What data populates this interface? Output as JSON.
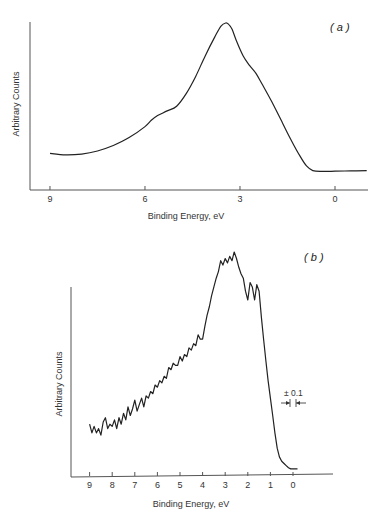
{
  "chart_data": [
    {
      "type": "line",
      "panel_label": "( a )",
      "title": "",
      "xlabel": "Binding Energy, eV",
      "ylabel": "Arbitrary Counts",
      "x_ticks": [
        9,
        6,
        3,
        0
      ],
      "x_tick_labels": [
        "9",
        "6",
        "3",
        "0"
      ],
      "xlim": [
        9.3,
        -1.0
      ],
      "ylim": [
        0,
        100
      ],
      "x_reversed": true,
      "grid": false,
      "legend": null,
      "series": [
        {
          "name": "Spectrum (a)",
          "x": [
            9.0,
            8.5,
            8.0,
            7.5,
            7.0,
            6.5,
            6.0,
            5.8,
            5.6,
            5.3,
            5.0,
            4.7,
            4.4,
            4.1,
            3.8,
            3.6,
            3.45,
            3.35,
            3.25,
            3.1,
            2.9,
            2.7,
            2.5,
            2.3,
            2.0,
            1.7,
            1.4,
            1.1,
            0.9,
            0.7,
            0.4,
            0.0,
            -0.5,
            -1.0
          ],
          "y": [
            17,
            16,
            16.5,
            18.5,
            22,
            27,
            34,
            38,
            41,
            44,
            47,
            55,
            66,
            79,
            91,
            98,
            100,
            99,
            96,
            88,
            79,
            73,
            68,
            61,
            50,
            38,
            26,
            15,
            9,
            6,
            5.5,
            5.6,
            5.8,
            6
          ]
        }
      ]
    },
    {
      "type": "line",
      "panel_label": "( b )",
      "title": "",
      "xlabel": "Binding Energy, eV",
      "ylabel": "Arbitrary Counts",
      "x_ticks": [
        9,
        8,
        7,
        6,
        5,
        4,
        3,
        2,
        1,
        0
      ],
      "x_tick_labels": [
        "9",
        "8",
        "7",
        "6",
        "5",
        "4",
        "3",
        "2",
        "1",
        "0"
      ],
      "xlim": [
        9.8,
        -1.8
      ],
      "ylim": [
        0,
        100
      ],
      "x_reversed": true,
      "grid": false,
      "legend": null,
      "annotations": [
        {
          "text": "± 0.1",
          "x": 0.5,
          "y": 36,
          "note": "energy resolution bar with inward arrows"
        }
      ],
      "series": [
        {
          "name": "Spectrum (b)",
          "x": [
            9.0,
            8.9,
            8.8,
            8.7,
            8.6,
            8.5,
            8.4,
            8.3,
            8.2,
            8.1,
            8.0,
            7.9,
            7.8,
            7.7,
            7.6,
            7.5,
            7.4,
            7.3,
            7.2,
            7.1,
            7.0,
            6.9,
            6.8,
            6.7,
            6.6,
            6.5,
            6.4,
            6.3,
            6.2,
            6.1,
            6.0,
            5.9,
            5.8,
            5.7,
            5.6,
            5.5,
            5.4,
            5.3,
            5.2,
            5.1,
            5.0,
            4.9,
            4.8,
            4.7,
            4.6,
            4.5,
            4.4,
            4.3,
            4.2,
            4.1,
            4.0,
            3.9,
            3.8,
            3.7,
            3.6,
            3.5,
            3.4,
            3.3,
            3.2,
            3.1,
            3.0,
            2.9,
            2.8,
            2.7,
            2.6,
            2.5,
            2.4,
            2.3,
            2.2,
            2.1,
            2.0,
            1.9,
            1.8,
            1.7,
            1.6,
            1.5,
            1.4,
            1.3,
            1.2,
            1.1,
            1.0,
            0.9,
            0.8,
            0.7,
            0.6,
            0.5,
            0.4,
            0.3,
            0.2,
            0.1,
            0.0,
            -0.1,
            -0.2
          ],
          "y": [
            21,
            17,
            20,
            17,
            19,
            16,
            22,
            24,
            19,
            21,
            20,
            23,
            19,
            24,
            21,
            26,
            23,
            29,
            25,
            28,
            32,
            27,
            30,
            33,
            29,
            34,
            33,
            36,
            35,
            39,
            38,
            41,
            40,
            43,
            42,
            47,
            46,
            49,
            48,
            48,
            52,
            50,
            53,
            52,
            56,
            55,
            58,
            57,
            62,
            60,
            60,
            66,
            71,
            75,
            80,
            84,
            88,
            91,
            96,
            94,
            97,
            95,
            98,
            96,
            100,
            97,
            93,
            90,
            88,
            82,
            78,
            86,
            84,
            78,
            85,
            82,
            70,
            60,
            50,
            41,
            33,
            25,
            17,
            10,
            6,
            4,
            3,
            2,
            1,
            0.5,
            0.5,
            0.5,
            0.5
          ]
        }
      ]
    }
  ],
  "panels": {
    "a": {
      "label": "( a )",
      "ylabel": "Arbitrary Counts",
      "xlabel": "Binding Energy, eV",
      "ticks": [
        "9",
        "6",
        "3",
        "0"
      ]
    },
    "b": {
      "label": "( b )",
      "ylabel": "Arbitrary Counts",
      "xlabel": "Binding Energy, eV",
      "ticks": [
        "9",
        "8",
        "7",
        "6",
        "5",
        "4",
        "3",
        "2",
        "1",
        "0"
      ],
      "annotation": "± 0.1"
    }
  },
  "colors": {
    "line": "#222222",
    "axis": "#555555",
    "background": "#ffffff"
  }
}
